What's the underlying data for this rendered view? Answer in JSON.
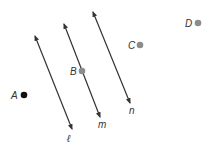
{
  "colors": {
    "line": "#333333",
    "point_dark": "#111111",
    "point_gray": "#8c8c8c",
    "label": "#333333"
  },
  "lines": [
    {
      "name": "l",
      "label": "ℓ",
      "x1": 35,
      "y1": 36,
      "x2": 72,
      "y2": 129,
      "label_x": 67,
      "label_y": 142
    },
    {
      "name": "m",
      "label": "m",
      "x1": 64,
      "y1": 24,
      "x2": 100,
      "y2": 117,
      "label_x": 98,
      "label_y": 128
    },
    {
      "name": "n",
      "label": "n",
      "x1": 93,
      "y1": 12,
      "x2": 130,
      "y2": 103,
      "label_x": 129,
      "label_y": 114
    }
  ],
  "points": [
    {
      "name": "A",
      "label": "A",
      "x": 24,
      "y": 95,
      "color": "#111111",
      "label_x": 11,
      "label_y": 99
    },
    {
      "name": "B",
      "label": "B",
      "x": 82,
      "y": 71,
      "color": "#8c8c8c",
      "label_x": 70,
      "label_y": 75
    },
    {
      "name": "C",
      "label": "C",
      "x": 140,
      "y": 45,
      "color": "#8c8c8c",
      "label_x": 128,
      "label_y": 49
    },
    {
      "name": "D",
      "label": "D",
      "x": 198,
      "y": 23,
      "color": "#8c8c8c",
      "label_x": 185,
      "label_y": 27
    }
  ]
}
